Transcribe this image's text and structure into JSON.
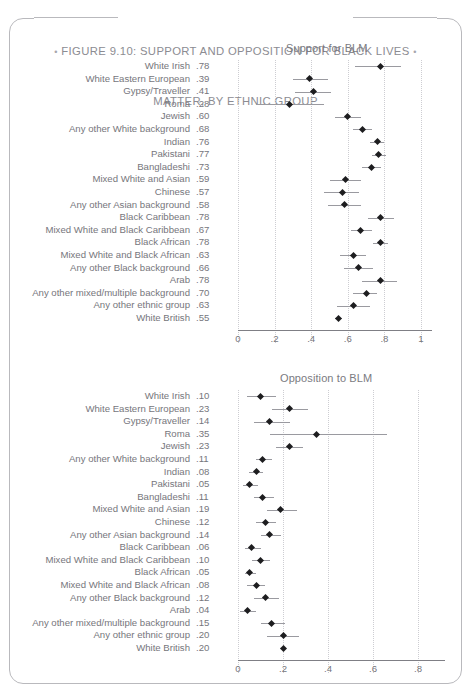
{
  "figure": {
    "title_line1": "FIGURE 9.10: SUPPORT AND OPPOSITION FOR BLACK LIVES",
    "title_line2": "MATTER, BY ETHNIC GROUP",
    "bullet": "•"
  },
  "chart_data": [
    {
      "type": "scatter",
      "title": "Support for BLM",
      "xlabel": "",
      "ylabel": "",
      "xlim": [
        0,
        1.06
      ],
      "xticks": [
        0,
        0.2,
        0.4,
        0.6,
        0.8,
        1
      ],
      "xticklabels": [
        "0",
        ".2",
        ".4",
        ".6",
        ".8",
        "1"
      ],
      "grid": "vertical-dotted",
      "legend": "none",
      "orientation": "horizontal",
      "categories": [
        "White Irish",
        "White Eastern European",
        "Gypsy/Traveller",
        "Roma",
        "Jewish",
        "Any other White background",
        "Indian",
        "Pakistani",
        "Bangladeshi",
        "Mixed White and Asian",
        "Chinese",
        "Any other Asian background",
        "Black Caribbean",
        "Mixed White and Black Caribbean",
        "Black African",
        "Mixed White and Black African",
        "Any other Black background",
        "Arab",
        "Any other mixed/multiple background",
        "Any other ethnic group",
        "White British"
      ],
      "value_labels": [
        ".78",
        ".39",
        ".41",
        ".28",
        ".60",
        ".68",
        ".76",
        ".77",
        ".73",
        ".59",
        ".57",
        ".58",
        ".78",
        ".67",
        ".78",
        ".63",
        ".66",
        ".78",
        ".70",
        ".63",
        ".55"
      ],
      "values": [
        0.78,
        0.39,
        0.41,
        0.28,
        0.6,
        0.68,
        0.76,
        0.77,
        0.73,
        0.59,
        0.57,
        0.58,
        0.78,
        0.67,
        0.78,
        0.63,
        0.66,
        0.78,
        0.7,
        0.63,
        0.55
      ],
      "ci_low": [
        0.64,
        0.3,
        0.31,
        0.1,
        0.53,
        0.63,
        0.72,
        0.73,
        0.68,
        0.5,
        0.47,
        0.49,
        0.71,
        0.62,
        0.74,
        0.56,
        0.58,
        0.68,
        0.63,
        0.54,
        0.53
      ],
      "ci_high": [
        0.89,
        0.49,
        0.51,
        0.47,
        0.67,
        0.73,
        0.8,
        0.81,
        0.78,
        0.67,
        0.66,
        0.67,
        0.85,
        0.73,
        0.82,
        0.7,
        0.74,
        0.87,
        0.76,
        0.72,
        0.57
      ]
    },
    {
      "type": "scatter",
      "title": "Opposition to BLM",
      "xlabel": "",
      "ylabel": "",
      "xlim": [
        0,
        0.92
      ],
      "xticks": [
        0,
        0.2,
        0.4,
        0.6,
        0.8
      ],
      "xticklabels": [
        "0",
        ".2",
        ".4",
        ".6",
        ".8"
      ],
      "grid": "vertical-dotted",
      "legend": "none",
      "orientation": "horizontal",
      "categories": [
        "White Irish",
        "White Eastern European",
        "Gypsy/Traveller",
        "Roma",
        "Jewish",
        "Any other White background",
        "Indian",
        "Pakistani",
        "Bangladeshi",
        "Mixed White and Asian",
        "Chinese",
        "Any other Asian background",
        "Black Caribbean",
        "Mixed White and Black Caribbean",
        "Black African",
        "Mixed White and Black African",
        "Any other Black background",
        "Arab",
        "Any other mixed/multiple background",
        "Any other ethnic group",
        "White British"
      ],
      "value_labels": [
        ".10",
        ".23",
        ".14",
        ".35",
        ".23",
        ".11",
        ".08",
        ".05",
        ".11",
        ".19",
        ".12",
        ".14",
        ".06",
        ".10",
        ".05",
        ".08",
        ".12",
        ".04",
        ".15",
        ".20",
        ".20"
      ],
      "values": [
        0.1,
        0.23,
        0.14,
        0.35,
        0.23,
        0.11,
        0.08,
        0.05,
        0.11,
        0.19,
        0.12,
        0.14,
        0.06,
        0.1,
        0.05,
        0.08,
        0.12,
        0.04,
        0.15,
        0.2,
        0.2
      ],
      "ci_low": [
        0.04,
        0.15,
        0.07,
        0.14,
        0.17,
        0.08,
        0.05,
        0.02,
        0.07,
        0.13,
        0.08,
        0.1,
        0.03,
        0.06,
        0.03,
        0.04,
        0.07,
        0.01,
        0.1,
        0.13,
        0.19
      ],
      "ci_high": [
        0.17,
        0.31,
        0.23,
        0.66,
        0.29,
        0.15,
        0.11,
        0.09,
        0.16,
        0.26,
        0.17,
        0.19,
        0.1,
        0.14,
        0.08,
        0.12,
        0.18,
        0.08,
        0.21,
        0.27,
        0.21
      ]
    }
  ]
}
